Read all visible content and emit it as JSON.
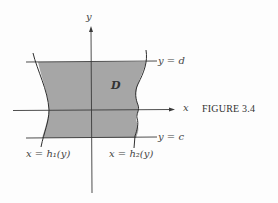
{
  "figure": {
    "caption": "FIGURE 3.4",
    "axes": {
      "x_label": "x",
      "y_label": "y"
    },
    "region_label": "D",
    "boundaries": {
      "top": "y = d",
      "bottom": "y = c",
      "left": "x = h₁(y)",
      "right": "x = h₂(y)"
    },
    "colors": {
      "region_fill": "#a6a6a6",
      "lines": "#3a3a3a",
      "background": "#fdfdfd"
    }
  }
}
